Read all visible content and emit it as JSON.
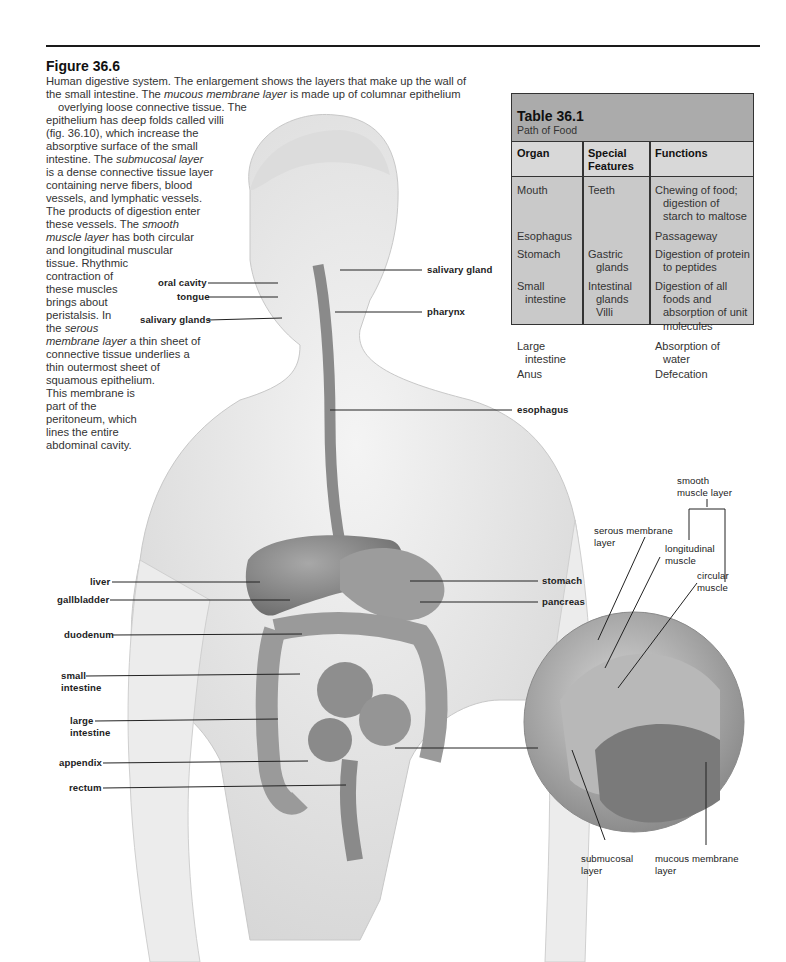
{
  "figure": {
    "title": "Figure 36.6",
    "caption_lines": [
      "Human digestive system. The enlargement shows the layers that make up the wall of",
      "the small intestine. The ",
      "mucous membrane layer",
      " is made up of columnar epithelium",
      "overlying loose connective tissue. The",
      "epithelium has deep folds called villi",
      "(fig. 36.10), which increase the",
      "absorptive surface of the small",
      "intestine. The ",
      "submucosal layer",
      "is a dense connective tissue layer",
      "containing nerve fibers, blood",
      "vessels, and lymphatic vessels.",
      "The products of digestion enter",
      "these vessels. The ",
      "smooth",
      "muscle layer",
      " has both circular",
      "and longitudinal muscular",
      "tissue. Rhythmic",
      "contraction of",
      "these muscles",
      "brings about",
      "peristalsis. In",
      "the ",
      "serous",
      "membrane layer",
      " a thin sheet of",
      "connective tissue underlies a",
      "thin outermost sheet of",
      "squamous epithelium.",
      "This membrane is",
      "part of the",
      "peritoneum, which",
      "lines the entire",
      "abdominal cavity."
    ],
    "labels": {
      "oral_cavity": "oral cavity",
      "tongue": "tongue",
      "salivary_glands": "salivary glands",
      "salivary_gland": "salivary gland",
      "pharynx": "pharynx",
      "esophagus": "esophagus",
      "stomach": "stomach",
      "pancreas": "pancreas",
      "liver": "liver",
      "gallbladder": "gallbladder",
      "duodenum": "duodenum",
      "small_intestine_1": "small",
      "small_intestine_2": "intestine",
      "large_intestine_1": "large",
      "large_intestine_2": "intestine",
      "appendix": "appendix",
      "rectum": "rectum"
    },
    "enlargement_labels": {
      "smooth_muscle_1": "smooth",
      "smooth_muscle_2": "muscle layer",
      "serous_1": "serous membrane",
      "serous_2": "layer",
      "longitudinal_1": "longitudinal",
      "longitudinal_2": "muscle",
      "circular_1": "circular",
      "circular_2": "muscle",
      "submucosal_1": "submucosal",
      "submucosal_2": "layer",
      "mucous_1": "mucous membrane",
      "mucous_2": "layer"
    }
  },
  "table": {
    "title": "Table 36.1",
    "subtitle": "Path of Food",
    "headers": {
      "organ": "Organ",
      "features_1": "Special",
      "features_2": "Features",
      "functions": "Functions"
    },
    "rows": [
      {
        "organ": [
          "Mouth"
        ],
        "features": [
          "Teeth"
        ],
        "functions": [
          "Chewing of food;",
          "digestion of",
          "starch to maltose"
        ]
      },
      {
        "organ": [
          "Esophagus"
        ],
        "features": [],
        "functions": [
          "Passageway"
        ]
      },
      {
        "organ": [
          "Stomach"
        ],
        "features": [
          "Gastric",
          "glands"
        ],
        "functions": [
          "Digestion of protein",
          "to peptides"
        ]
      },
      {
        "organ": [
          "Small",
          "intestine"
        ],
        "features": [
          "Intestinal",
          "glands",
          "Villi"
        ],
        "functions": [
          "Digestion of all",
          "foods and",
          "absorption of unit",
          "molecules"
        ]
      },
      {
        "organ": [
          "Large",
          "intestine"
        ],
        "features": [],
        "functions": [
          "Absorption of",
          "water"
        ]
      },
      {
        "organ": [
          "Anus"
        ],
        "features": [],
        "functions": [
          "Defecation"
        ]
      }
    ]
  },
  "colors": {
    "table_bg": "#c9c9c9",
    "table_header": "#ababab",
    "rule": "#1a1a1a"
  }
}
